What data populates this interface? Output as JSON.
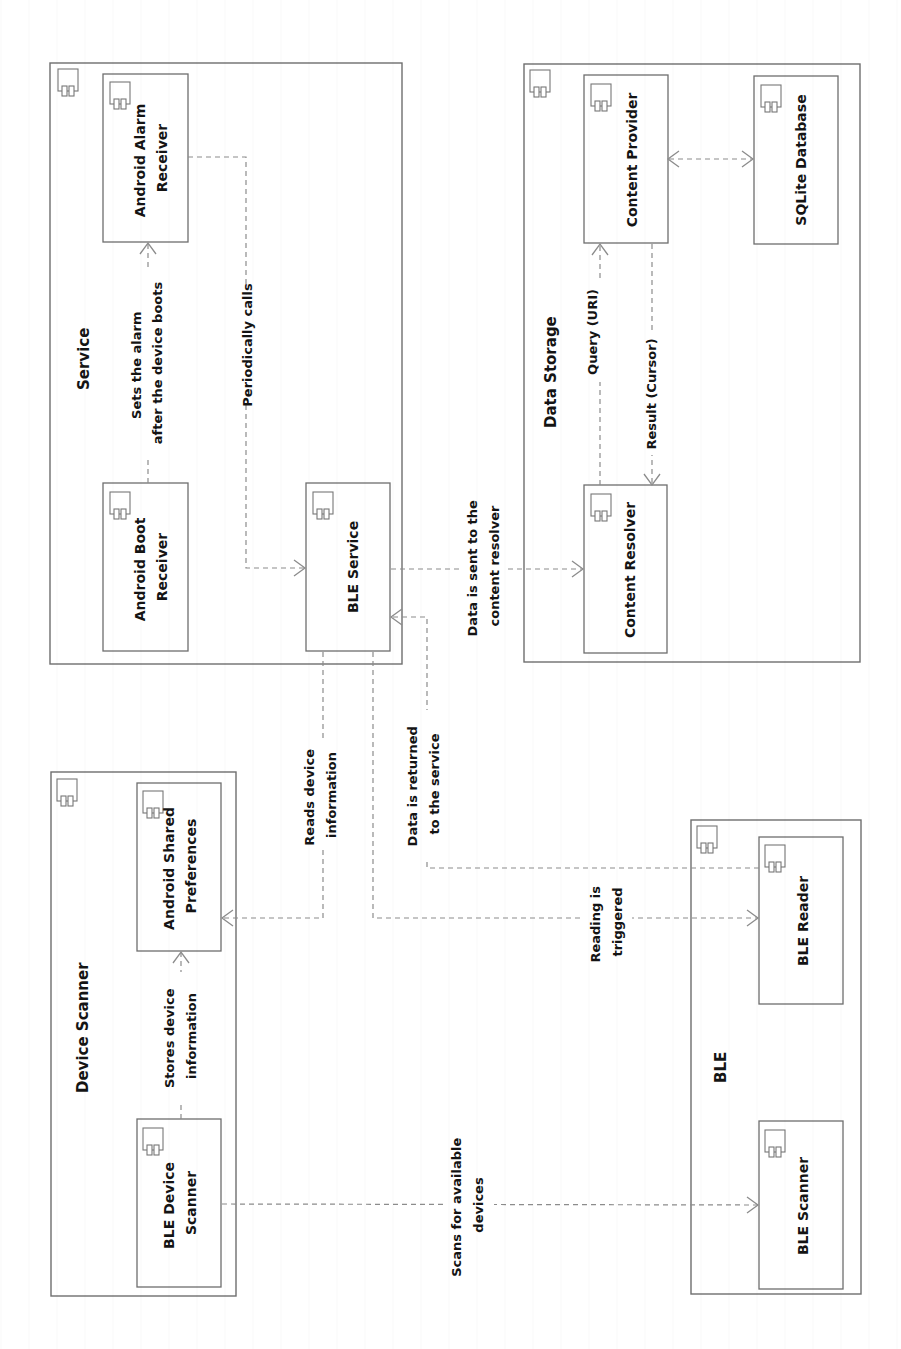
{
  "diagram": {
    "type": "UML component diagram",
    "orientation": "rotated 90° counter-clockwise",
    "colors": {
      "stroke": "#6e6e6e",
      "edge": "#8c8c8c",
      "text": "#141414",
      "background": "#ffffff"
    }
  },
  "packages": {
    "service": {
      "title": "Service"
    },
    "data_storage": {
      "title": "Data Storage"
    },
    "device_scanner": {
      "title": "Device Scanner"
    },
    "ble": {
      "title": "BLE"
    }
  },
  "components": {
    "alarm_receiver": {
      "line1": "Android Alarm",
      "line2": "Receiver"
    },
    "boot_receiver": {
      "line1": "Android Boot",
      "line2": "Receiver"
    },
    "ble_service": {
      "line1": "BLE Service"
    },
    "content_provider": {
      "line1": "Content Provider"
    },
    "sqlite_db": {
      "line1": "SQLite Database"
    },
    "content_resolver": {
      "line1": "Content Resolver"
    },
    "shared_prefs": {
      "line1": "Android Shared",
      "line2": "Preferences"
    },
    "ble_device_scanner": {
      "line1": "BLE Device",
      "line2": "Scanner"
    },
    "ble_reader": {
      "line1": "BLE Reader"
    },
    "ble_scanner": {
      "line1": "BLE Scanner"
    }
  },
  "edges": {
    "sets_alarm": {
      "line1": "Sets the alarm",
      "line2": "after the device boots"
    },
    "periodically_calls": {
      "line1": "Periodically calls"
    },
    "data_sent": {
      "line1": "Data is sent to the",
      "line2": "content resolver"
    },
    "query": {
      "line1": "Query (URI)"
    },
    "result": {
      "line1": "Result (Cursor)"
    },
    "reads_info": {
      "line1": "Reads device",
      "line2": "information"
    },
    "data_returned": {
      "line1": "Data is returned",
      "line2": "to the service"
    },
    "reading_triggered": {
      "line1": "Reading is",
      "line2": "triggered"
    },
    "stores_info": {
      "line1": "Stores device",
      "line2": "information"
    },
    "scans": {
      "line1": "Scans for available",
      "line2": "devices"
    }
  }
}
